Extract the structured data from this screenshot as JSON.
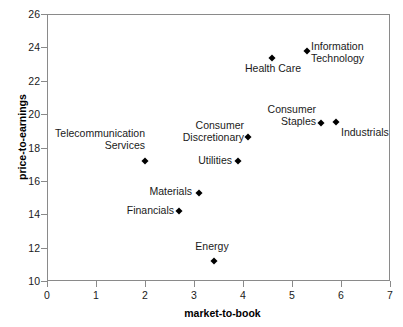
{
  "chart_data": {
    "type": "scatter",
    "title": "",
    "xlabel": "market-to-book",
    "ylabel": "price-to-earnings",
    "xlim": [
      0,
      7
    ],
    "ylim": [
      10,
      26
    ],
    "xticks": [
      "0",
      "1",
      "2",
      "3",
      "4",
      "5",
      "6",
      "7"
    ],
    "yticks": [
      "10",
      "12",
      "14",
      "16",
      "18",
      "20",
      "22",
      "24",
      "26"
    ],
    "grid": false,
    "legend": "none",
    "marker_color": "#000000",
    "marker_shape": "diamond",
    "frame_color": "#8a8a8a",
    "points": [
      {
        "label": "Telecommunication\nServices",
        "x": 2.0,
        "y": 17.2,
        "label_align": "right",
        "label_left": 35,
        "label_top": 128,
        "label_width": 110
      },
      {
        "label": "Financials",
        "x": 2.7,
        "y": 14.2,
        "label_align": "right",
        "label_left": 98,
        "label_top": 205,
        "label_width": 76
      },
      {
        "label": "Materials",
        "x": 3.1,
        "y": 15.3,
        "label_align": "right",
        "label_left": 120,
        "label_top": 186,
        "label_width": 72
      },
      {
        "label": "Energy",
        "x": 3.4,
        "y": 11.2,
        "label_align": "center",
        "label_left": 186,
        "label_top": 241,
        "label_width": 52
      },
      {
        "label": "Utilities",
        "x": 3.9,
        "y": 17.2,
        "label_align": "right",
        "label_left": 170,
        "label_top": 155,
        "label_width": 62
      },
      {
        "label": "Consumer\nDiscretionary",
        "x": 4.1,
        "y": 18.6,
        "label_align": "right",
        "label_left": 168,
        "label_top": 120,
        "label_width": 76
      },
      {
        "label": "Health Care",
        "x": 4.6,
        "y": 23.35,
        "label_align": "center",
        "label_left": 239,
        "label_top": 63,
        "label_width": 68
      },
      {
        "label": "Information\nTechnology",
        "x": 5.3,
        "y": 23.8,
        "label_align": "left",
        "label_left": 311,
        "label_top": 41,
        "label_width": 84
      },
      {
        "label": "Consumer\nStaples",
        "x": 5.6,
        "y": 19.45,
        "label_align": "right",
        "label_left": 250,
        "label_top": 104,
        "label_width": 66
      },
      {
        "label": "Industrials",
        "x": 5.9,
        "y": 19.55,
        "label_align": "left",
        "label_left": 341,
        "label_top": 127,
        "label_width": 62
      }
    ]
  }
}
